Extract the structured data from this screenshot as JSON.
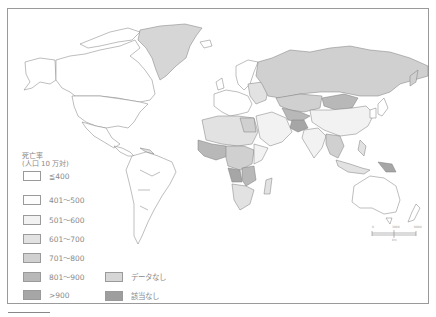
{
  "legend": {
    "title_line1": "死亡率",
    "title_line2": "(人口 10 万対)",
    "items": [
      {
        "label": "≦400",
        "color": "#ffffff"
      },
      {
        "label": "401～500",
        "color": "#fdfdfd"
      },
      {
        "label": "501～600",
        "color": "#f2f2f2"
      },
      {
        "label": "601～700",
        "color": "#e2e2e2"
      },
      {
        "label": "701～800",
        "color": "#d0d0d0"
      },
      {
        "label": "801～900",
        "color": "#b8b8b8"
      },
      {
        "label": ">900",
        "color": "#a6a6a6"
      }
    ],
    "special": [
      {
        "label": "データなし",
        "color": "#d6d6d6"
      },
      {
        "label": "該当なし",
        "color": "#9e9e9e"
      }
    ]
  },
  "scale_bar": {
    "labels": [
      "0",
      "3000",
      "6000"
    ],
    "unit": "km"
  },
  "colors": {
    "border": "#8a8a8a",
    "frame": "#9a9a9a",
    "water": "#ffffff"
  }
}
